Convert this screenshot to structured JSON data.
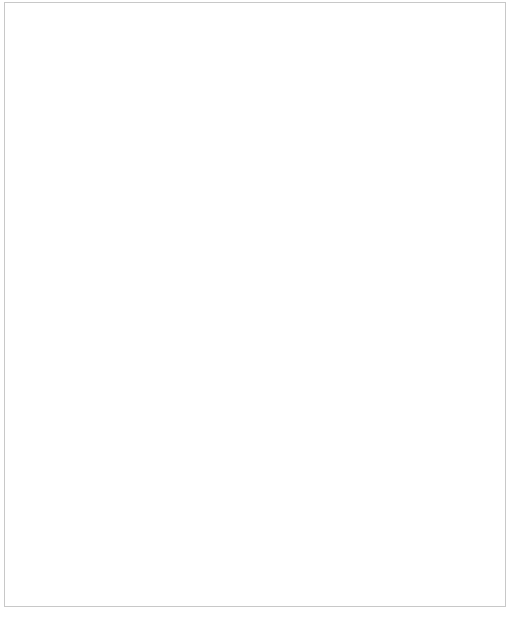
{
  "chart_data": {
    "type": "line",
    "title": "",
    "xlabel": "temperature (°C)",
    "ylabel": "solubility (g/100 cm³ water)",
    "xlim": [
      0,
      100
    ],
    "ylim": [
      0,
      250
    ],
    "grid": false,
    "legend_position": "inline-annotations",
    "xticks": [
      0,
      5,
      10,
      15,
      20,
      25,
      30,
      35,
      40,
      45,
      50,
      55,
      60,
      65,
      70,
      75,
      80,
      85,
      90,
      95,
      100
    ],
    "yticks": [
      0,
      10,
      20,
      30,
      40,
      50,
      60,
      70,
      80,
      90,
      100,
      110,
      120,
      130,
      140,
      150,
      160,
      170,
      180,
      190,
      200,
      210,
      220,
      230,
      240,
      250
    ],
    "x": [
      0,
      10,
      20,
      30,
      40,
      50,
      60,
      70,
      80,
      90,
      100
    ],
    "series": [
      {
        "name": "potassium iodide",
        "color": "#8a8a8a",
        "values": [
          128,
          136,
          144,
          152,
          160,
          176,
          192,
          208,
          226,
          243,
          260
        ],
        "label_text": "potassium iodide",
        "label_x": 96,
        "label_y": 148,
        "leader": "157,153 195,179"
      },
      {
        "name": "sodium nitrate",
        "color": "#707070",
        "values": [
          73,
          80,
          88,
          96,
          104,
          114,
          124,
          136,
          148,
          163,
          180
        ],
        "label_text": "sodium nitrate",
        "label_x": 110,
        "label_y": 315,
        "leader": "145,322 145,376"
      },
      {
        "name": "potassium nitrate",
        "color": "#a8a8a8",
        "values": [
          13,
          21,
          32,
          46,
          64,
          86,
          110,
          138,
          169,
          205,
          245
        ],
        "label_text": "potassium nitrate",
        "label_x": 313,
        "label_y": 173,
        "leader": "352,180 398,211"
      },
      {
        "name": "sodium chloride",
        "color": "#606060",
        "values": [
          35.7,
          35.8,
          36.0,
          36.3,
          36.6,
          37.0,
          37.3,
          37.8,
          38.4,
          39.0,
          39.8
        ],
        "label_text": "sodium chloride",
        "label_x": 292,
        "label_y": 440,
        "leader": "332,446 332,486"
      },
      {
        "name": "potassium chlorate",
        "color": "#a8a8a8",
        "values": [
          4,
          6,
          8.5,
          11.5,
          15,
          19.5,
          25,
          31,
          38,
          47,
          57
        ],
        "label_text": "potassium chlorate",
        "label_x": 339,
        "label_y": 540,
        "leader": "337,533 272,503"
      }
    ]
  },
  "axes": {
    "x_axis_name": "temperature-axis",
    "y_axis_name": "solubility-axis",
    "arrow_icon": "axis-arrow-icon"
  }
}
